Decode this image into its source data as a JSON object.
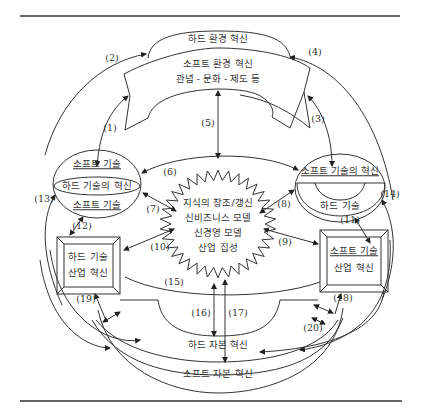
{
  "diagram": {
    "top_arch": {
      "hard_env": "하드 환경 혁신",
      "soft_env": "소프트 환경 혁신",
      "soft_env_sub": "관념 - 문화 - 제도 등"
    },
    "left_ellipse": {
      "top": "소프트 기술",
      "middle": "하드 기술의 혁신",
      "bottom": "소프트 기술"
    },
    "right_ellipse": {
      "top": "소프트 기술의 혁신",
      "bottom": "하드 기술"
    },
    "center_star": {
      "line1": "지식의 창조/갱신",
      "line2": "신비즈니스 모델",
      "line3": "신경영 모델",
      "line4": "산업 집성"
    },
    "left_box": {
      "line1": "하드 기술",
      "line2": "산업 혁신"
    },
    "right_box": {
      "line1": "소프트 기술",
      "line2": "산업 혁신"
    },
    "bottom_arch": {
      "hard_capital": "하드 자본 혁신",
      "soft_capital": "소프트 자본 혁신"
    },
    "arrow_labels": [
      "(1)",
      "(2)",
      "(3)",
      "(4)",
      "(5)",
      "(6)",
      "(7)",
      "(8)",
      "(9)",
      "(10)",
      "(11)",
      "(12)",
      "(13)",
      "(14)",
      "(15)",
      "(16)",
      "(17)",
      "(18)",
      "(19)",
      "(20)"
    ]
  }
}
